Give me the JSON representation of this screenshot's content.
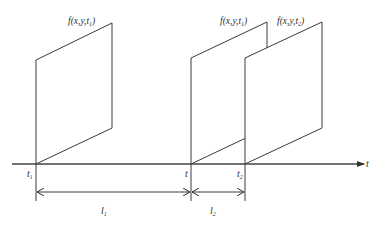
{
  "diagram": {
    "type": "time-axis frame sequence",
    "axis": {
      "label": "t",
      "color": "#444444"
    },
    "frames": [
      {
        "id": "frame-t1",
        "label_base": "f(x,y,t",
        "label_sub": "1",
        "label_close": ")",
        "full_label": "f(x,y,t1)"
      },
      {
        "id": "frame-t",
        "label_base": "f(x,y,t",
        "label_sub": "1",
        "label_close": ")",
        "full_label": "f(x,y,t1)"
      },
      {
        "id": "frame-t2",
        "label_base": "f(x,y,t",
        "label_sub": "2",
        "label_close": ")",
        "full_label": "f(x,y,t2)"
      }
    ],
    "ticks": [
      {
        "base": "t",
        "sub": "1"
      },
      {
        "base": "t",
        "sub": ""
      },
      {
        "base": "t",
        "sub": "2"
      }
    ],
    "intervals": [
      {
        "base": "l",
        "sub": "1",
        "from": "t1",
        "to": "t"
      },
      {
        "base": "l",
        "sub": "2",
        "from": "t",
        "to": "t2"
      }
    ],
    "line_color": "#3a3a3a"
  }
}
